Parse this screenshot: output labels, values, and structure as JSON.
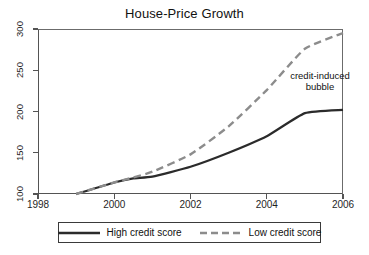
{
  "chart_data": {
    "type": "line",
    "title": "House-Price Growth",
    "xlabel": "",
    "ylabel": "",
    "xlim": [
      1998,
      2006
    ],
    "ylim": [
      100,
      300
    ],
    "grid": false,
    "legend_position": "bottom",
    "xticks": [
      1998,
      2000,
      2002,
      2004,
      2006
    ],
    "xtick_labels": [
      "1998",
      "2000",
      "2002",
      "2004",
      "2006"
    ],
    "yticks": [
      100,
      150,
      200,
      250,
      300
    ],
    "ytick_labels": [
      "100",
      "150",
      "200",
      "250",
      "300"
    ],
    "series": [
      {
        "name": "High credit score",
        "style": "solid",
        "color": "#2b2b2b",
        "x": [
          1999.0,
          2000.0,
          2000.5,
          2001.0,
          2002.0,
          2003.0,
          2004.0,
          2005.0,
          2006.0
        ],
        "values": [
          100,
          114,
          119,
          121,
          133,
          150,
          170,
          198,
          202
        ]
      },
      {
        "name": "Low credit score",
        "style": "dashed",
        "color": "#8c8c8c",
        "x": [
          1999.0,
          2000.0,
          2000.5,
          2001.0,
          2002.0,
          2003.0,
          2004.0,
          2005.0,
          2006.0
        ],
        "values": [
          100,
          114,
          120,
          127,
          148,
          182,
          226,
          276,
          295
        ]
      }
    ],
    "annotations": [
      {
        "text_line_1": "credit-induced",
        "text_line_2": "bubble",
        "x": 2004.4,
        "y": 243
      }
    ]
  },
  "legend": {
    "entries": [
      {
        "label": "High credit score",
        "style": "solid"
      },
      {
        "label": "Low credit score",
        "style": "dashed"
      }
    ]
  }
}
